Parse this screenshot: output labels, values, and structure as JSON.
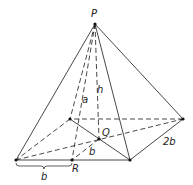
{
  "figure": {
    "shape": "pyramid",
    "base": "rectangle",
    "points": {
      "P": {
        "label": "P",
        "role": "apex"
      },
      "Q": {
        "label": "Q",
        "role": "base-center"
      },
      "R": {
        "label": "R",
        "role": "midpoint-front-edge"
      },
      "A": {
        "label": "",
        "role": "front-left-vertex"
      },
      "B": {
        "label": "",
        "role": "front-right-vertex"
      },
      "C": {
        "label": "",
        "role": "back-right-vertex"
      },
      "D": {
        "label": "",
        "role": "back-left-vertex"
      }
    },
    "segments": [
      {
        "from": "P",
        "to": "A",
        "style": "solid"
      },
      {
        "from": "P",
        "to": "B",
        "style": "solid"
      },
      {
        "from": "P",
        "to": "C",
        "style": "solid"
      },
      {
        "from": "P",
        "to": "D",
        "style": "dashed"
      },
      {
        "from": "P",
        "to": "R",
        "style": "dashed",
        "label": "a"
      },
      {
        "from": "P",
        "to": "Q",
        "style": "dashed",
        "label": "h"
      },
      {
        "from": "A",
        "to": "B",
        "style": "solid"
      },
      {
        "from": "B",
        "to": "C",
        "style": "solid",
        "label": "2b"
      },
      {
        "from": "C",
        "to": "D",
        "style": "dashed"
      },
      {
        "from": "D",
        "to": "A",
        "style": "dashed"
      },
      {
        "from": "A",
        "to": "C",
        "style": "dashed"
      },
      {
        "from": "D",
        "to": "B",
        "style": "solid"
      },
      {
        "from": "Q",
        "to": "R",
        "style": "dashed",
        "label": "b"
      }
    ],
    "labels": {
      "apex": "P",
      "center": "Q",
      "midpoint": "R",
      "slant_height": "a",
      "height": "h",
      "half_width_inner": "b",
      "half_width_bracket": "b",
      "side_length": "2b"
    }
  }
}
